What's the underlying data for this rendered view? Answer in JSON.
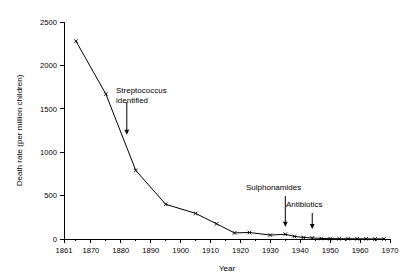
{
  "chart_data": {
    "type": "line",
    "title": "",
    "subtitle": "",
    "xlabel": "Year",
    "ylabel": "Death rate (per million children)",
    "xlim": [
      1861,
      1970
    ],
    "ylim": [
      0,
      2500
    ],
    "grid": false,
    "legend": "none",
    "x_ticks": [
      1861,
      1870,
      1880,
      1890,
      1900,
      1910,
      1920,
      1930,
      1940,
      1950,
      1960,
      1970
    ],
    "x_tick_labels": [
      "1861",
      "1870",
      "1880",
      "1890",
      "1900",
      "1910",
      "1920",
      "1930",
      "1940",
      "1950",
      "1960",
      "1970"
    ],
    "y_ticks": [
      0,
      500,
      1000,
      1500,
      2000,
      2500
    ],
    "y_tick_labels": [
      "0",
      "500",
      "1000",
      "1500",
      "2000",
      "2500"
    ],
    "series": [
      {
        "name": "Scarlet fever death rate",
        "marker": "x",
        "x": [
          1865,
          1875,
          1885,
          1895,
          1905,
          1912,
          1918,
          1923,
          1930,
          1935,
          1938,
          1941,
          1944,
          1947,
          1950,
          1953,
          1956,
          1959,
          1962,
          1965,
          1968
        ],
        "values": [
          2280,
          1670,
          790,
          400,
          295,
          175,
          70,
          75,
          45,
          55,
          30,
          18,
          12,
          6,
          4,
          3,
          3,
          2,
          2,
          1,
          1
        ]
      }
    ],
    "annotations": [
      {
        "label_line1": "Streptococcus",
        "label_line2": "identified",
        "target_x": 1882,
        "target_y": 1200,
        "arrow": "down"
      },
      {
        "label_line1": "Sulphonamides",
        "label_line2": "",
        "target_x": 1935,
        "target_y": 140,
        "arrow": "down"
      },
      {
        "label_line1": "Antibiotics",
        "label_line2": "",
        "target_x": 1944,
        "target_y": 115,
        "arrow": "down"
      }
    ]
  },
  "colors": {
    "background": "#ffffff",
    "axis": "#000000",
    "line": "#000000",
    "text": "#000000"
  }
}
